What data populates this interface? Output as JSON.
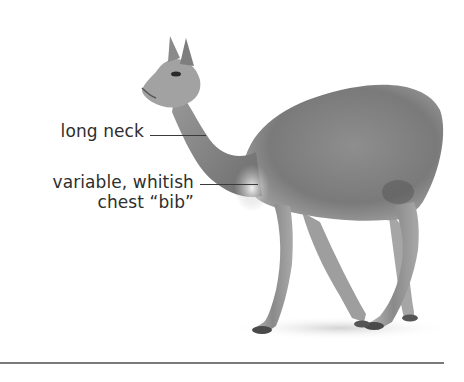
{
  "figure": {
    "labels": [
      {
        "id": "long-neck",
        "text": "long neck"
      },
      {
        "id": "chest-bib",
        "lines": [
          "variable, whitish",
          "chest “bib”"
        ]
      }
    ]
  },
  "colors": {
    "text": "#2e2e2e",
    "leader": "#3a3a3a",
    "rule": "#7a7a7a",
    "fur_dark": "#6e6e6e",
    "fur_mid": "#9a9a9a",
    "fur_light": "#d8d8d8"
  }
}
